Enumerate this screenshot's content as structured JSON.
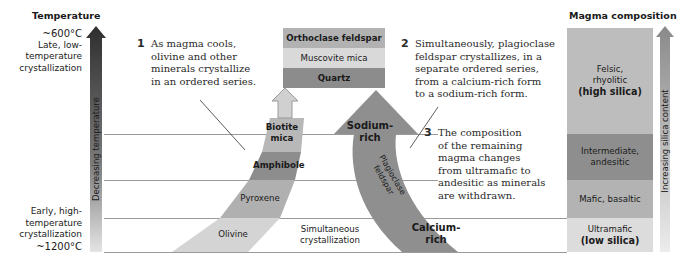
{
  "temperature_axis": {
    "title": "Temperature",
    "top_temp": "~600°C",
    "top_label_lines": [
      "Late, low-",
      "temperature",
      "crystallization"
    ],
    "bottom_label_lines": [
      "Early, high-",
      "temperature",
      "crystallization"
    ],
    "bottom_temp": "~1200°C",
    "arrow_label": "Decreasing temperature"
  },
  "notes": [
    {
      "number": "1",
      "lines": [
        "As magma cools,",
        "olivine and other",
        "minerals crystallize",
        "in an ordered series."
      ]
    },
    {
      "number": "2",
      "lines": [
        "Simultaneously, plagioclase",
        "feldspar crystallizes, in a",
        "separate ordered series,",
        "from a calcium-rich form",
        "to a sodium-rich form."
      ]
    },
    {
      "number": "3",
      "lines": [
        "The composition",
        "of the remaining",
        "magma changes",
        "from ultramafic to",
        "andesitic as minerals",
        "are withdrawn."
      ]
    }
  ],
  "late_minerals": [
    {
      "label": "Orthoclase feldspar",
      "color": "#b2b2b2"
    },
    {
      "label": "Muscovite mica",
      "color": "#d9d9d9"
    },
    {
      "label": "Quartz",
      "color": "#8c8c8c"
    }
  ],
  "discontinuous_series": [
    {
      "label_lines": [
        "Biotite",
        "mica"
      ],
      "color": "#b8b8b8"
    },
    {
      "label_lines": [
        "Amphibole"
      ],
      "color": "#8d8d8d"
    },
    {
      "label_lines": [
        "Pyroxene"
      ],
      "color": "#b0b0b0"
    },
    {
      "label_lines": [
        "Olivine"
      ],
      "color": "#d4d4d4"
    }
  ],
  "continuous_series": {
    "top_label_lines": [
      "Sodium-",
      "rich"
    ],
    "middle_label_lines": [
      "Plagioclase",
      "feldspar"
    ],
    "bottom_label_lines": [
      "Calcium-",
      "rich"
    ],
    "color": "#8f8f8f"
  },
  "simultaneous_label_lines": [
    "Simultaneous",
    "crystallization"
  ],
  "magma_composition": {
    "title": "Magma composition",
    "levels": [
      {
        "lines": [
          "Felsic,",
          "rhyolitic"
        ],
        "bold": "(high silica)",
        "color": "#bdbdbd"
      },
      {
        "lines": [
          "Intermediate,",
          "andesitic"
        ],
        "bold": "",
        "color": "#8e8e8e"
      },
      {
        "lines": [
          "Mafic, basaltic"
        ],
        "bold": "",
        "color": "#b3b3b3"
      },
      {
        "lines": [
          "Ultramafic"
        ],
        "bold": "(low silica)",
        "color": "#dcdcdc"
      }
    ],
    "arrow_label": "Increasing silica content"
  }
}
